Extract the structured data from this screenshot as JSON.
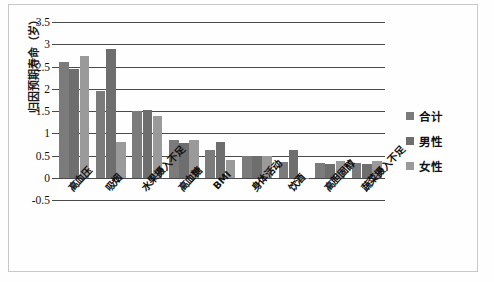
{
  "chart_data": {
    "type": "bar",
    "title": "",
    "xlabel": "",
    "ylabel": "归因预期寿命（岁）",
    "ylim": [
      -0.5,
      3.5
    ],
    "ytick_labels": [
      "3.5",
      "3",
      "2.5",
      "2",
      "1.5",
      "1",
      "0.5",
      "0",
      "-0.5"
    ],
    "ytick_values": [
      3.5,
      3,
      2.5,
      2,
      1.5,
      1,
      0.5,
      0,
      -0.5
    ],
    "grid": true,
    "legend_position": "right",
    "categories": [
      "高血压",
      "吸烟",
      "水果摄入不足",
      "高血糖",
      "BMI",
      "身体活动",
      "饮酒",
      "高胆固醇",
      "蔬菜摄入不足"
    ],
    "series": [
      {
        "name": "合计",
        "color": "#7b7b7b",
        "values": [
          2.6,
          1.95,
          1.49,
          0.84,
          0.63,
          0.48,
          0.35,
          0.33,
          0.33
        ]
      },
      {
        "name": "男性",
        "color": "#6e6e6e",
        "values": [
          2.44,
          2.89,
          1.52,
          0.79,
          0.81,
          0.5,
          0.63,
          0.31,
          0.3
        ]
      },
      {
        "name": "女性",
        "color": "#9a9a9a",
        "values": [
          2.74,
          0.81,
          1.38,
          0.85,
          0.4,
          0.48,
          -0.03,
          0.38,
          0.37
        ]
      }
    ]
  },
  "legend": {
    "items": [
      {
        "label": "合计",
        "color": "#7b7b7b"
      },
      {
        "label": "男性",
        "color": "#6e6e6e"
      },
      {
        "label": "女性",
        "color": "#9a9a9a"
      }
    ]
  }
}
